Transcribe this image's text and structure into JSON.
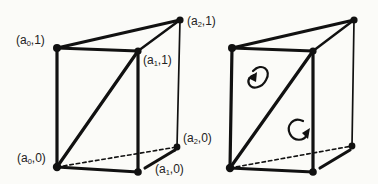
{
  "figure": {
    "left_prism": {
      "labels": {
        "a0_1": {
          "pre": "(a",
          "sub": "0",
          "post": ",1)"
        },
        "a1_1": {
          "pre": "(a",
          "sub": "1",
          "post": ",1)"
        },
        "a2_1": {
          "pre": "(a",
          "sub": "2",
          "post": ",1)"
        },
        "a0_0": {
          "pre": "(a",
          "sub": "0",
          "post": ",0)"
        },
        "a1_0": {
          "pre": "(a",
          "sub": "1",
          "post": ",0)"
        },
        "a2_0": {
          "pre": "(a",
          "sub": "2",
          "post": ",0)"
        }
      }
    },
    "right_prism": {
      "orientation_arrows": [
        "counterclockwise-curl",
        "clockwise-curl"
      ]
    },
    "colors": {
      "ink": "#111111",
      "background": "#fbfbf8"
    }
  }
}
